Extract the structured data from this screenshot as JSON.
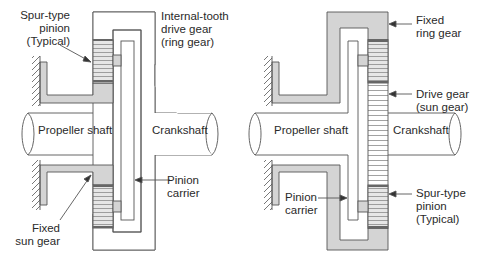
{
  "left_diagram": {
    "labels": {
      "spur_pinion": [
        "Spur-type",
        "pinion",
        "(Typical)"
      ],
      "ring_gear": [
        "Internal-tooth",
        "drive gear",
        "(ring gear)"
      ],
      "propeller_shaft": "Propeller shaft",
      "crankshaft": "Crankshaft",
      "pinion_carrier": [
        "Pinion",
        "carrier"
      ],
      "sun_gear": [
        "Fixed",
        "sun gear"
      ]
    }
  },
  "right_diagram": {
    "labels": {
      "ring_gear": [
        "Fixed",
        "ring gear"
      ],
      "drive_gear": [
        "Drive gear",
        "(sun gear)"
      ],
      "propeller_shaft": "Propeller shaft",
      "crankshaft": "Crankshaft",
      "pinion_carrier": [
        "Pinion",
        "carrier"
      ],
      "spur_pinion": [
        "Spur-type",
        "pinion",
        "(Typical)"
      ]
    }
  },
  "colors": {
    "fixed_fill": "#d4d4d4",
    "outline": "#555555",
    "gear_dark": "#7a7a7a"
  }
}
